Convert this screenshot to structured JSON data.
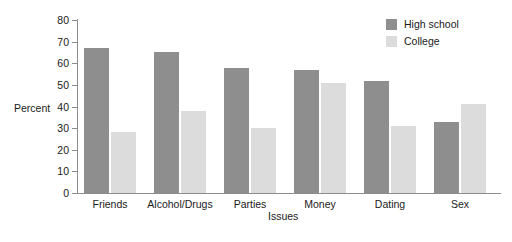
{
  "chart_data": {
    "type": "bar",
    "title": "",
    "xlabel": "Issues",
    "ylabel": "Percent",
    "ylim": [
      0,
      80
    ],
    "yticks": [
      0,
      10,
      20,
      30,
      40,
      50,
      60,
      70,
      80
    ],
    "grid": false,
    "legend_position": "top-right",
    "categories": [
      "Friends",
      "Alcohol/Drugs",
      "Parties",
      "Money",
      "Dating",
      "Sex"
    ],
    "series": [
      {
        "name": "High school",
        "color": "#8e8e8e",
        "values": [
          67,
          65,
          58,
          57,
          52,
          33
        ]
      },
      {
        "name": "College",
        "color": "#dcdcdc",
        "values": [
          28,
          38,
          30,
          51,
          31,
          41
        ]
      }
    ]
  },
  "legend": {
    "items": [
      {
        "label": "High school",
        "color": "#8e8e8e"
      },
      {
        "label": "College",
        "color": "#dcdcdc"
      }
    ]
  },
  "axes": {
    "y_title": "Percent",
    "x_title": "Issues",
    "axis_color": "#8c8c8c"
  }
}
